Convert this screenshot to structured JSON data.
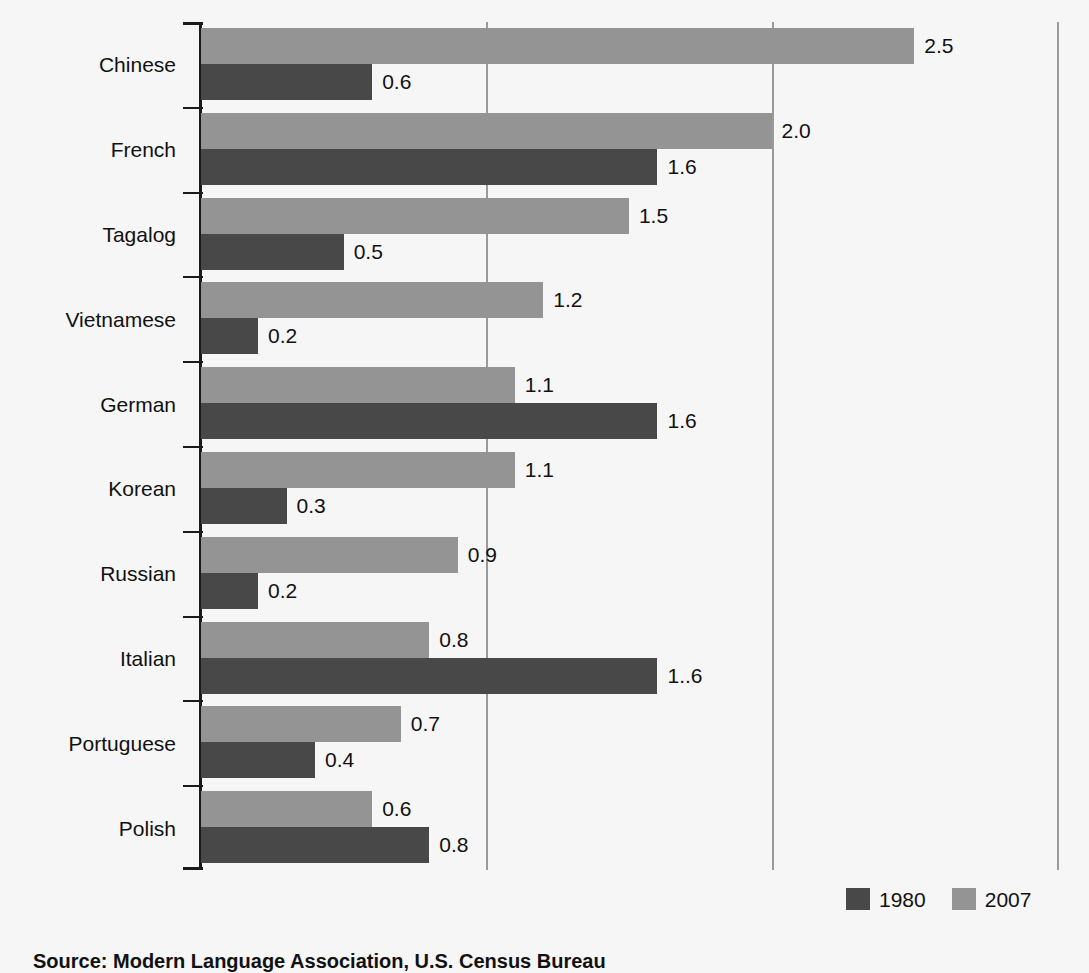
{
  "chart_data": {
    "type": "bar",
    "orientation": "horizontal",
    "title": "",
    "xlabel": "",
    "ylabel": "",
    "xlim": [
      0,
      3.0
    ],
    "grid": true,
    "gridlines": [
      1.0,
      2.0,
      3.0
    ],
    "legend_position": "bottom-right",
    "categories": [
      "Chinese",
      "French",
      "Tagalog",
      "Vietnamese",
      "German",
      "Korean",
      "Russian",
      "Italian",
      "Portuguese",
      "Polish"
    ],
    "series": [
      {
        "name": "1980",
        "color": "#484848",
        "values": [
          0.6,
          1.6,
          0.5,
          0.2,
          1.6,
          0.3,
          0.2,
          1.6,
          0.4,
          0.8
        ],
        "labels": [
          "0.6",
          "1.6",
          "0.5",
          "0.2",
          "1.6",
          "0.3",
          "0.2",
          "1..6",
          "0.4",
          "0.8"
        ]
      },
      {
        "name": "2007",
        "color": "#949494",
        "values": [
          2.5,
          2.0,
          1.5,
          1.2,
          1.1,
          1.1,
          0.9,
          0.8,
          0.7,
          0.6
        ],
        "labels": [
          "2.5",
          "2.0",
          "1.5",
          "1.2",
          "1.1",
          "1.1",
          "0.9",
          "0.8",
          "0.7",
          "0.6"
        ]
      }
    ]
  },
  "legend": {
    "items": [
      {
        "label": "1980",
        "color": "#484848"
      },
      {
        "label": "2007",
        "color": "#949494"
      }
    ]
  },
  "source": {
    "text": "Source: Modern Language Association, U.S. Census Bureau"
  },
  "colors": {
    "background": "#f6f6f6",
    "axis": "#1a1a1a",
    "grid": "#9a9a9a",
    "series_1980": "#484848",
    "series_2007": "#949494"
  }
}
